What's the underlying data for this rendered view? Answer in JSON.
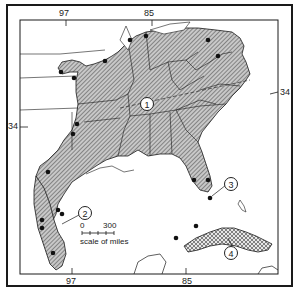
{
  "map": {
    "longitude_labels_top": [
      "97",
      "85"
    ],
    "longitude_labels_bottom": [
      "97",
      "85"
    ],
    "latitude_labels_left": [
      "34"
    ],
    "latitude_labels_right": [
      "34"
    ],
    "scale": {
      "start": "0",
      "end": "300",
      "caption": "scale of miles"
    },
    "callouts": [
      {
        "id": "1",
        "label": "1"
      },
      {
        "id": "2",
        "label": "2"
      },
      {
        "id": "3",
        "label": "3"
      },
      {
        "id": "4",
        "label": "4"
      }
    ],
    "colors": {
      "range_fill": "#9a9a9a",
      "cuba_fill": "#bdbdbd",
      "outline": "#1a1a1a",
      "background": "#ffffff"
    }
  }
}
